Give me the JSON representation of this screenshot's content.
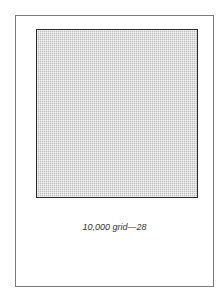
{
  "figure": {
    "caption": "10,000 grid—28",
    "grid_label": "10,000 grid",
    "figure_number": "28"
  },
  "colors": {
    "frame_border": "#7a7a7a",
    "grid_border": "#2a2a2a",
    "grid_fill": "#bdbdbd"
  }
}
